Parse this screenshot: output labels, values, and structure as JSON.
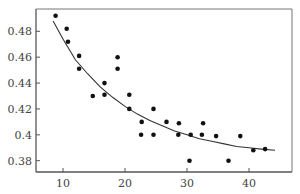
{
  "chart_data": {
    "type": "scatter",
    "title": "",
    "xlabel": "",
    "ylabel": "",
    "xlim": [
      5.5,
      45.7
    ],
    "ylim": [
      0.371,
      0.5
    ],
    "grid": false,
    "legend": null,
    "x_ticks": [
      10,
      20,
      30,
      40
    ],
    "x_tick_labels": [
      "10",
      "20",
      "30",
      "40"
    ],
    "y_ticks": [
      0.38,
      0.4,
      0.42,
      0.44,
      0.46,
      0.48
    ],
    "y_tick_labels": [
      "0.38",
      "0.4",
      "0.42",
      "0.44",
      "0.46",
      "0.48"
    ],
    "series": [
      {
        "name": "observations",
        "kind": "scatter",
        "points": [
          [
            8.8,
            0.492
          ],
          [
            10.6,
            0.482
          ],
          [
            10.8,
            0.472
          ],
          [
            12.6,
            0.461
          ],
          [
            12.6,
            0.451
          ],
          [
            18.8,
            0.46
          ],
          [
            18.8,
            0.451
          ],
          [
            16.7,
            0.44
          ],
          [
            14.8,
            0.43
          ],
          [
            16.7,
            0.431
          ],
          [
            20.7,
            0.431
          ],
          [
            20.7,
            0.42
          ],
          [
            24.6,
            0.42
          ],
          [
            22.7,
            0.41
          ],
          [
            26.7,
            0.41
          ],
          [
            28.7,
            0.409
          ],
          [
            32.6,
            0.409
          ],
          [
            22.6,
            0.4
          ],
          [
            24.6,
            0.4
          ],
          [
            28.6,
            0.4
          ],
          [
            30.6,
            0.4
          ],
          [
            32.4,
            0.4
          ],
          [
            34.7,
            0.399
          ],
          [
            38.6,
            0.399
          ],
          [
            40.7,
            0.388
          ],
          [
            42.6,
            0.389
          ],
          [
            30.4,
            0.38
          ],
          [
            36.7,
            0.38
          ]
        ]
      },
      {
        "name": "fitted curve",
        "kind": "line",
        "points": [
          [
            8.4,
            0.488
          ],
          [
            10,
            0.474
          ],
          [
            12,
            0.458
          ],
          [
            14,
            0.447
          ],
          [
            16,
            0.437
          ],
          [
            18,
            0.429
          ],
          [
            20,
            0.422
          ],
          [
            22,
            0.416
          ],
          [
            24,
            0.411
          ],
          [
            26,
            0.407
          ],
          [
            28,
            0.403
          ],
          [
            30,
            0.4
          ],
          [
            32,
            0.397
          ],
          [
            34,
            0.395
          ],
          [
            36,
            0.393
          ],
          [
            38,
            0.391
          ],
          [
            40,
            0.39
          ],
          [
            42,
            0.389
          ],
          [
            44.2,
            0.388
          ]
        ]
      }
    ]
  },
  "style": {
    "point_color": "#111111",
    "line_color": "#333333",
    "axis_color": "#555555"
  }
}
